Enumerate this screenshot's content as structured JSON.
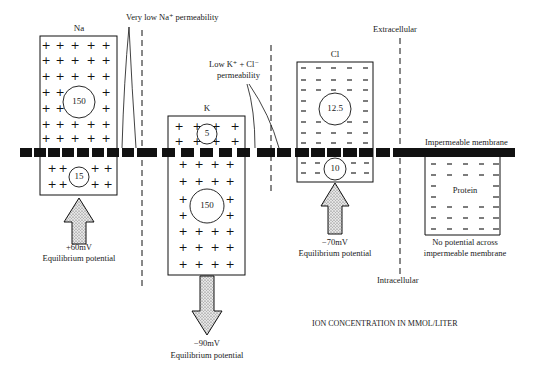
{
  "diagram": {
    "regions": {
      "top": "Extracellular",
      "bottom": "Intracellular"
    },
    "annotations": {
      "na_permeability": "Very low Na⁺ permeability",
      "k_cl_permeability_line1": "Low K⁺ + Cl⁻",
      "k_cl_permeability_line2": "permeability",
      "impermeable_membrane": "Impermeable membrane",
      "units_note": "ION CONCENTRATION IN MMOL/LITER"
    },
    "ions": [
      {
        "name": "Na",
        "symbol": "+",
        "extracellular_conc": "150",
        "intracellular_conc": "15",
        "potential": "+60mV",
        "potential_label": "Equilibrium potential",
        "arrow_direction": "up"
      },
      {
        "name": "K",
        "symbol": "+",
        "extracellular_conc": "5",
        "intracellular_conc": "150",
        "potential": "−90mV",
        "potential_label": "Equilibrium potential",
        "arrow_direction": "down"
      },
      {
        "name": "Cl",
        "symbol": "−",
        "extracellular_conc": "12.5",
        "intracellular_conc": "10",
        "potential": "−70mV",
        "potential_label": "Equilibrium potential",
        "arrow_direction": "up"
      }
    ],
    "protein": {
      "name": "Protein",
      "symbol": "−",
      "note_line1": "No potential across",
      "note_line2": "impermeable membrane"
    },
    "colors": {
      "ink": "#111111",
      "membrane": "#111111",
      "arrow_fill_stipple": "#bdbdbd",
      "background": "#ffffff"
    }
  }
}
